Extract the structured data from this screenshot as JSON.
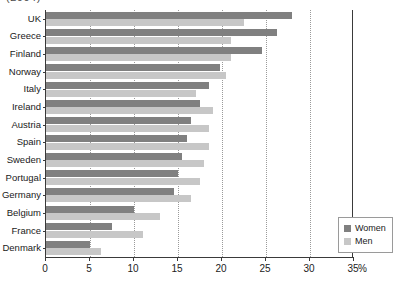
{
  "title_fragment": "(2004)",
  "legend": {
    "position": "inside-bottom-right",
    "items": [
      {
        "label": "Women",
        "color": "#808080",
        "icon": "square-swatch-icon"
      },
      {
        "label": "Men",
        "color": "#c7c7c7",
        "icon": "square-swatch-icon"
      }
    ]
  },
  "axis": {
    "x_unit": "%",
    "ticks": [
      "0",
      "5",
      "10",
      "15",
      "20",
      "25",
      "30",
      "35"
    ]
  },
  "chart_data": {
    "type": "bar",
    "orientation": "horizontal",
    "title": "(2004)",
    "xlabel": "%",
    "ylabel": "",
    "xlim": [
      0,
      35
    ],
    "xticks": [
      0,
      5,
      10,
      15,
      20,
      25,
      30,
      35
    ],
    "grid": "vertical-dotted",
    "legend_position": "bottom-right",
    "categories": [
      "UK",
      "Greece",
      "Finland",
      "Norway",
      "Italy",
      "Ireland",
      "Austria",
      "Spain",
      "Sweden",
      "Portugal",
      "Germany",
      "Belgium",
      "France",
      "Denmark"
    ],
    "series": [
      {
        "name": "Women",
        "color": "#808080",
        "values": [
          28.0,
          26.2,
          24.5,
          19.8,
          18.5,
          17.5,
          16.5,
          16.0,
          15.5,
          15.0,
          14.5,
          10.0,
          7.5,
          5.0
        ]
      },
      {
        "name": "Men",
        "color": "#c7c7c7",
        "values": [
          22.5,
          21.0,
          21.0,
          20.5,
          17.0,
          19.0,
          18.5,
          18.5,
          18.0,
          17.5,
          16.5,
          13.0,
          11.0,
          6.3
        ]
      }
    ]
  }
}
